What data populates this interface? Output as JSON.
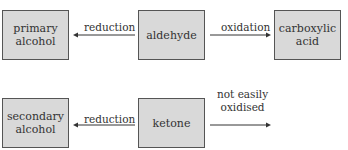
{
  "nodes": {
    "primary_alcohol": "primary\nalcohol",
    "aldehyde": "aldehyde",
    "carboxylic_acid": "carboxylic\nacid",
    "secondary_alcohol": "secondary\nalcohol",
    "ketone": "ketone"
  },
  "nodes_lines": {
    "primary_alcohol": [
      "primary",
      "alcohol"
    ],
    "carboxylic_acid": [
      "carboxylic",
      "acid"
    ],
    "secondary_alcohol": [
      "secondary",
      "alcohol"
    ]
  },
  "edges": {
    "aldehyde_to_primary": "reduction",
    "aldehyde_to_carboxylic": "oxidation",
    "ketone_to_secondary": "reduction",
    "ketone_no_oxidation": [
      "not easily",
      "oxidised"
    ]
  },
  "colors": {
    "box_fill": "#d9d9d9",
    "box_border": "#555555",
    "arrow": "#333333"
  }
}
